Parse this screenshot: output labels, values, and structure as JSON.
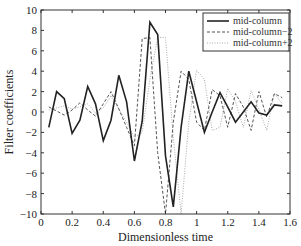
{
  "chart_data": {
    "type": "line",
    "title": "",
    "xlabel": "Dimensionless time",
    "ylabel": "Filter coefficients",
    "xlim": [
      0,
      1.6
    ],
    "ylim": [
      -10,
      10
    ],
    "xticks": [
      0,
      0.2,
      0.4,
      0.6,
      0.8,
      1,
      1.2,
      1.4,
      1.6
    ],
    "xtick_labels": [
      "0",
      "0.2",
      "0.4",
      "0.6",
      "0.8",
      "1",
      "1.2",
      "1.4",
      "1.6"
    ],
    "yticks": [
      -10,
      -8,
      -6,
      -4,
      -2,
      0,
      2,
      4,
      6,
      8,
      10
    ],
    "ytick_labels": [
      "−10",
      "−8",
      "−6",
      "−4",
      "−2",
      "0",
      "2",
      "4",
      "6",
      "8",
      "10"
    ],
    "grid": false,
    "legend_position": "upper right",
    "x": [
      0.05,
      0.1,
      0.15,
      0.2,
      0.25,
      0.3,
      0.35,
      0.4,
      0.45,
      0.5,
      0.55,
      0.6,
      0.65,
      0.7,
      0.75,
      0.8,
      0.85,
      0.9,
      0.95,
      1.0,
      1.05,
      1.1,
      1.15,
      1.2,
      1.25,
      1.3,
      1.35,
      1.4,
      1.45,
      1.5,
      1.55
    ],
    "series": [
      {
        "name": "mid-column",
        "style": "solid",
        "color": "#222222",
        "values": [
          -1.5,
          2.0,
          1.3,
          -2.1,
          -0.8,
          2.5,
          0.8,
          -2.8,
          -0.8,
          3.6,
          1.0,
          -4.8,
          -0.9,
          8.8,
          7.6,
          -4.3,
          -9.3,
          -1.5,
          4.0,
          1.0,
          -2.0,
          0.0,
          1.9,
          0.5,
          -1.0,
          0.0,
          1.0,
          -0.1,
          -0.3,
          0.7,
          0.6
        ]
      },
      {
        "name": "mid-column−2",
        "style": "dashed",
        "color": "#555555",
        "values": [
          0.5,
          0.1,
          -0.3,
          0.2,
          0.9,
          0.2,
          -0.4,
          0.8,
          2.0,
          0.3,
          -1.5,
          -3.3,
          7.2,
          7.3,
          -4.0,
          -10.0,
          -1.0,
          4.0,
          3.2,
          -1.0,
          -1.8,
          2.2,
          1.6,
          -1.5,
          1.8,
          0.5,
          -1.8,
          2.0,
          -0.5,
          1.8,
          1.4
        ]
      },
      {
        "name": "mid-column+2",
        "style": "dotted",
        "color": "#aaaaaa",
        "values": [
          0.2,
          0.4,
          0.6,
          0.3,
          0.5,
          0.8,
          -0.1,
          0.4,
          1.6,
          0.3,
          -1.0,
          -2.5,
          -2.0,
          3.2,
          7.3,
          7.3,
          -2.5,
          -10.0,
          -1.0,
          4.1,
          3.2,
          -1.8,
          -1.5,
          2.3,
          1.0,
          -1.5,
          2.1,
          0.3,
          -1.8,
          1.8,
          0.8
        ]
      }
    ]
  },
  "legend": {
    "items": [
      "mid-column",
      "mid-column−2",
      "mid-column+2"
    ]
  }
}
